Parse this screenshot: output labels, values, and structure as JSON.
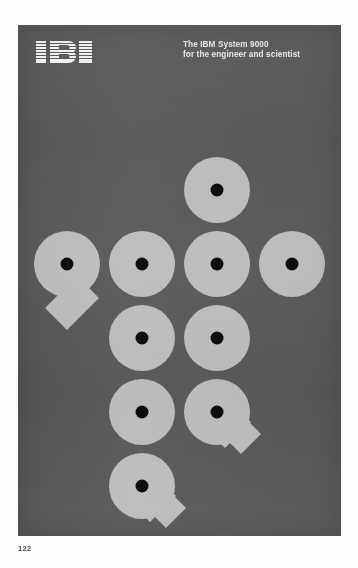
{
  "page": {
    "folio": "122",
    "background_color": "#fdfdfd"
  },
  "poster": {
    "panel_color": "#5b5b5b",
    "disk_color": "#bdbdbd",
    "hole_color": "#0d0d0d",
    "header": {
      "logo_name": "IBM",
      "logo_alt": "ibm-striped-logo",
      "title_line1": "The IBM System 9000",
      "title_line2": "for the engineer and scientist",
      "title_color": "#e9e9e9"
    },
    "artwork": {
      "description": "Ten light-gray disks with black center holes arranged on a grid; three of them carry diagonal tails forming the numeral 9.",
      "disk_diameter": 66,
      "hole_diameter": 13,
      "col_spacing": 75,
      "row_spacing": 74,
      "disks": [
        {
          "id": "disk-r1-c2",
          "row": 1,
          "col": 2,
          "cx": 199,
          "cy": 165,
          "shape": "circle",
          "tail": "none"
        },
        {
          "id": "disk-r2-c0",
          "row": 2,
          "col": 0,
          "cx": 49,
          "cy": 239,
          "shape": "nine",
          "tail": "down-left"
        },
        {
          "id": "disk-r2-c1",
          "row": 2,
          "col": 1,
          "cx": 124,
          "cy": 239,
          "shape": "circle",
          "tail": "none"
        },
        {
          "id": "disk-r2-c2",
          "row": 2,
          "col": 2,
          "cx": 199,
          "cy": 239,
          "shape": "circle",
          "tail": "none"
        },
        {
          "id": "disk-r2-c3",
          "row": 2,
          "col": 3,
          "cx": 274,
          "cy": 239,
          "shape": "circle",
          "tail": "none"
        },
        {
          "id": "disk-r3-c1",
          "row": 3,
          "col": 1,
          "cx": 124,
          "cy": 313,
          "shape": "circle",
          "tail": "none"
        },
        {
          "id": "disk-r3-c2",
          "row": 3,
          "col": 2,
          "cx": 199,
          "cy": 313,
          "shape": "circle",
          "tail": "none"
        },
        {
          "id": "disk-r4-c1",
          "row": 4,
          "col": 1,
          "cx": 124,
          "cy": 387,
          "shape": "circle",
          "tail": "none"
        },
        {
          "id": "disk-r4-c2",
          "row": 4,
          "col": 2,
          "cx": 199,
          "cy": 387,
          "shape": "nine",
          "tail": "down-right"
        },
        {
          "id": "disk-r5-c1",
          "row": 5,
          "col": 1,
          "cx": 124,
          "cy": 461,
          "shape": "nine",
          "tail": "down-right"
        }
      ]
    }
  }
}
